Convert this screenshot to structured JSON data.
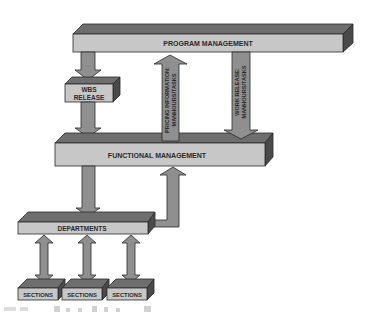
{
  "diagram": {
    "type": "organizational flow diagram",
    "colors": {
      "front_face": "#c7c7c7",
      "top_face": "#6e6e6e",
      "side_face": "#4a4a4a",
      "arrow_fill": "#8f8f8f",
      "outline": "#2a2a2a",
      "text": "#2a2a2a"
    },
    "nodes": {
      "program_management": "PROGRAM MANAGEMENT",
      "wbs_release_line1": "WBS",
      "wbs_release_line2": "RELEASE",
      "functional_management": "FUNCTIONAL MANAGEMENT",
      "departments": "DEPARTMENTS",
      "sections": [
        "SECTIONS",
        "SECTIONS",
        "SECTIONS"
      ]
    },
    "arrows": {
      "pricing_line1": "PRICING INFORMATION:",
      "pricing_line2": "MANHOURS/TASKS",
      "work_release_line1": "WORK RELEASE:",
      "work_release_line2": "MANHOURS/TASKS"
    },
    "edges": [
      {
        "from": "PROGRAM MANAGEMENT",
        "to": "WBS RELEASE",
        "direction": "down"
      },
      {
        "from": "WBS RELEASE",
        "to": "FUNCTIONAL MANAGEMENT",
        "direction": "down"
      },
      {
        "from": "FUNCTIONAL MANAGEMENT",
        "to": "PROGRAM MANAGEMENT",
        "label": "PRICING INFORMATION: MANHOURS/TASKS",
        "direction": "up"
      },
      {
        "from": "PROGRAM MANAGEMENT",
        "to": "FUNCTIONAL MANAGEMENT",
        "label": "WORK RELEASE: MANHOURS/TASKS",
        "direction": "down"
      },
      {
        "from": "FUNCTIONAL MANAGEMENT",
        "to": "DEPARTMENTS",
        "direction": "down"
      },
      {
        "from": "DEPARTMENTS",
        "to": "FUNCTIONAL MANAGEMENT",
        "direction": "up (L-shaped)"
      },
      {
        "from": "DEPARTMENTS",
        "to": "SECTIONS",
        "direction": "bidirectional",
        "count": 3
      }
    ]
  }
}
